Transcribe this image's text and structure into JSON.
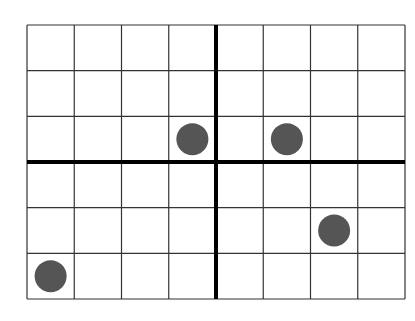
{
  "chart_data": {
    "type": "scatter",
    "title": "",
    "xlabel": "",
    "ylabel": "",
    "grid": true,
    "columns": 8,
    "rows": 6,
    "xlim": [
      -4,
      4
    ],
    "ylim": [
      -3,
      3
    ],
    "axis_position": {
      "x_axis_row_from_top": 3,
      "y_axis_col_from_left": 4
    },
    "points": [
      {
        "x": -0.5,
        "y": 0.5,
        "col": 4,
        "row": 3
      },
      {
        "x": 1.5,
        "y": 0.5,
        "col": 6,
        "row": 3
      },
      {
        "x": 2.5,
        "y": -1.5,
        "col": 7,
        "row": 5
      },
      {
        "x": -3.5,
        "y": -2.5,
        "col": 1,
        "row": 6
      }
    ],
    "colors": {
      "grid_line": "#333333",
      "axis_line": "#000000",
      "point_fill": "#555555",
      "background": "#ffffff"
    }
  },
  "layout": {
    "left": 27,
    "top": 25,
    "right": 405,
    "bottom": 299,
    "point_radius": 16
  }
}
